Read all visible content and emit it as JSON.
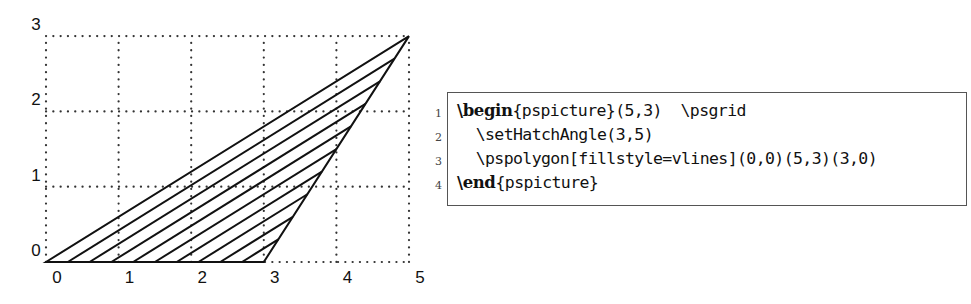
{
  "figure": {
    "x_ticks": [
      "0",
      "1",
      "2",
      "3",
      "4",
      "5"
    ],
    "y_ticks": [
      "0",
      "1",
      "2",
      "3"
    ],
    "grid": {
      "xmin": 0,
      "xmax": 5,
      "ymin": 0,
      "ymax": 3,
      "style": "dotted"
    },
    "polygon": {
      "vertices": [
        [
          0,
          0
        ],
        [
          5,
          3
        ],
        [
          3,
          0
        ]
      ],
      "fillstyle": "vlines",
      "hatch_angle_vector": [
        3,
        5
      ]
    },
    "colors": {
      "line": "#111111",
      "grid": "#333333",
      "background": "#ffffff"
    }
  },
  "code": {
    "lines": [
      {
        "num": "1",
        "kw_prefix": "\\",
        "kw": "begin",
        "rest": "{pspicture}(5,3)  \\psgrid"
      },
      {
        "num": "2",
        "kw_prefix": "",
        "kw": "",
        "rest": "  \\setHatchAngle(3,5)"
      },
      {
        "num": "3",
        "kw_prefix": "",
        "kw": "",
        "rest": "  \\pspolygon[fillstyle=vlines](0,0)(5,3)(3,0)"
      },
      {
        "num": "4",
        "kw_prefix": "\\",
        "kw": "end",
        "rest": "{pspicture}"
      }
    ]
  }
}
